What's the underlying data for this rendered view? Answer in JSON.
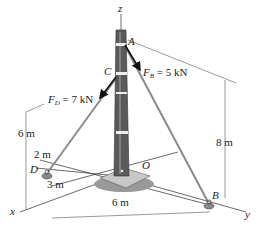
{
  "diagram": {
    "axes": {
      "x": "x",
      "y": "y",
      "z": "z"
    },
    "points": {
      "A": "A",
      "B": "B",
      "C": "C",
      "D": "D",
      "O": "O"
    },
    "forces": {
      "FB": {
        "symbol": "F",
        "sub": "B",
        "text": " = 5 kN"
      },
      "FD": {
        "symbol": "F",
        "sub": "D",
        "text": " = 7 kN"
      }
    },
    "dimensions": {
      "height_A": "8 m",
      "height_C": "6 m",
      "d_offset": "2 m",
      "x_offset": "3 m",
      "y_dist": "6 m"
    },
    "colors": {
      "pole": "#555555",
      "pole_dark": "#3a3a3a",
      "cable": "#888888",
      "line": "#444444",
      "arrow": "#111111"
    }
  }
}
